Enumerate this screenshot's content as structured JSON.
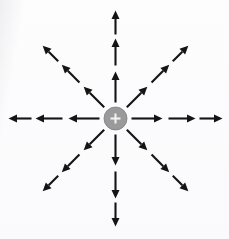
{
  "figure": {
    "kind": "physics-diagram",
    "caption": "",
    "background_color": "#fdfdfd",
    "width": 229,
    "height": 239
  },
  "charge": {
    "label": "+",
    "sign": "positive",
    "center_x": 115.5,
    "center_y": 118.5,
    "radius": 11.5,
    "fill_color": "#9a9a9a",
    "edge_color": "#7d7d7d",
    "symbol_color": "#f2f2f2",
    "symbol_arm": 5.0
  },
  "field": {
    "arrow_color": "#141414",
    "ray_count": 8,
    "arrows_per_ray": 3,
    "direction_sense": "outward",
    "shaft_width": 2.1,
    "head_length": 8.5,
    "head_half_width": 4.0,
    "rays": [
      {
        "name": "north",
        "label": "up",
        "angle_deg": 90,
        "arrows": [
          {
            "start_radius": 16,
            "end_radius": 47
          },
          {
            "start_radius": 53,
            "end_radius": 80
          },
          {
            "start_radius": 84,
            "end_radius": 108
          }
        ]
      },
      {
        "name": "northeast",
        "label": "up-right",
        "angle_deg": 45,
        "arrows": [
          {
            "start_radius": 16,
            "end_radius": 45
          },
          {
            "start_radius": 51,
            "end_radius": 76
          },
          {
            "start_radius": 81,
            "end_radius": 103
          }
        ]
      },
      {
        "name": "east",
        "label": "right",
        "angle_deg": 0,
        "arrows": [
          {
            "start_radius": 16,
            "end_radius": 47
          },
          {
            "start_radius": 53,
            "end_radius": 80
          },
          {
            "start_radius": 84,
            "end_radius": 107
          }
        ]
      },
      {
        "name": "southeast",
        "label": "down-right",
        "angle_deg": -45,
        "arrows": [
          {
            "start_radius": 16,
            "end_radius": 45
          },
          {
            "start_radius": 51,
            "end_radius": 76
          },
          {
            "start_radius": 81,
            "end_radius": 103
          }
        ]
      },
      {
        "name": "south",
        "label": "down",
        "angle_deg": -90,
        "arrows": [
          {
            "start_radius": 16,
            "end_radius": 47
          },
          {
            "start_radius": 53,
            "end_radius": 80
          },
          {
            "start_radius": 84,
            "end_radius": 108
          }
        ]
      },
      {
        "name": "southwest",
        "label": "down-left",
        "angle_deg": -135,
        "arrows": [
          {
            "start_radius": 16,
            "end_radius": 45
          },
          {
            "start_radius": 51,
            "end_radius": 76
          },
          {
            "start_radius": 81,
            "end_radius": 103
          }
        ]
      },
      {
        "name": "west",
        "label": "left",
        "angle_deg": 180,
        "arrows": [
          {
            "start_radius": 16,
            "end_radius": 47
          },
          {
            "start_radius": 53,
            "end_radius": 80
          },
          {
            "start_radius": 84,
            "end_radius": 107
          }
        ]
      },
      {
        "name": "northwest",
        "label": "up-left",
        "angle_deg": 135,
        "arrows": [
          {
            "start_radius": 16,
            "end_radius": 45
          },
          {
            "start_radius": 51,
            "end_radius": 76
          },
          {
            "start_radius": 81,
            "end_radius": 103
          }
        ]
      }
    ]
  },
  "margin_fragments": {
    "note": "partially cropped glyphs bleeding in from the left page edge",
    "items": [
      {
        "text": "t",
        "top": 3
      },
      {
        "text": "l",
        "top": 19
      },
      {
        "text": "r",
        "top": 40
      },
      {
        "text": "l",
        "top": 54
      },
      {
        "text": "c",
        "top": 78
      }
    ]
  }
}
